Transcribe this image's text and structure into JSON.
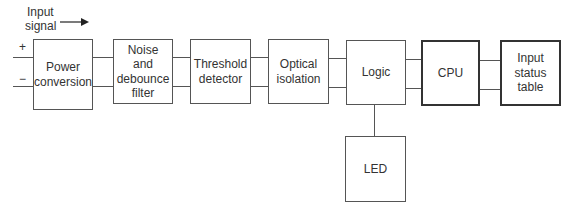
{
  "input_label": "Input\nsignal",
  "input_label_line1": "Input",
  "input_label_line2": "signal",
  "plus_sign": "+",
  "minus_sign": "−",
  "blocks": [
    {
      "id": "power",
      "label": "Power\nconversion"
    },
    {
      "id": "noise",
      "label": "Noise\nand\ndebounce\nfilter"
    },
    {
      "id": "threshold",
      "label": "Threshold\ndetector"
    },
    {
      "id": "optical",
      "label": "Optical\nisolation"
    },
    {
      "id": "logic",
      "label": "Logic"
    },
    {
      "id": "cpu",
      "label": "CPU"
    },
    {
      "id": "status",
      "label": "Input\nstatus\ntable"
    },
    {
      "id": "led",
      "label": "LED"
    }
  ],
  "colors": {
    "line": "#555555",
    "text": "#333333",
    "background": "#ffffff"
  }
}
